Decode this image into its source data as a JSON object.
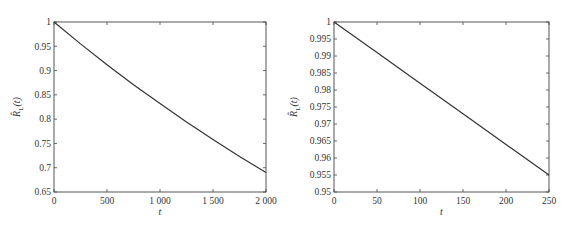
{
  "chart_data": [
    {
      "type": "line",
      "title": "",
      "xlabel": "t",
      "ylabel": "R̂_L(t)",
      "xlim": [
        0,
        2000
      ],
      "ylim": [
        0.65,
        1.0
      ],
      "grid": false,
      "legend": null,
      "x_ticks": [
        0,
        500,
        1000,
        1500,
        2000
      ],
      "x_tick_labels": [
        "0",
        "500",
        "1 000",
        "1 500",
        "2 000"
      ],
      "y_ticks": [
        0.65,
        0.7,
        0.75,
        0.8,
        0.85,
        0.9,
        0.95,
        1.0
      ],
      "y_tick_labels": [
        "0.65",
        "0.7",
        "0.75",
        "0.8",
        "0.85",
        "0.9",
        "0.95",
        "1"
      ],
      "series": [
        {
          "name": "R_L(t)",
          "color": "#333333",
          "x": [
            0,
            250,
            500,
            750,
            1000,
            1250,
            1500,
            1750,
            2000
          ],
          "y": [
            1.0,
            0.955,
            0.912,
            0.871,
            0.832,
            0.794,
            0.758,
            0.723,
            0.69
          ]
        }
      ]
    },
    {
      "type": "line",
      "title": "",
      "xlabel": "t",
      "ylabel": "R̂_L(t)",
      "xlim": [
        0,
        250
      ],
      "ylim": [
        0.95,
        1.0
      ],
      "grid": false,
      "legend": null,
      "x_ticks": [
        0,
        50,
        100,
        150,
        200,
        250
      ],
      "x_tick_labels": [
        "0",
        "50",
        "100",
        "150",
        "200",
        "250"
      ],
      "y_ticks": [
        0.95,
        0.955,
        0.96,
        0.965,
        0.97,
        0.975,
        0.98,
        0.985,
        0.99,
        0.995,
        1.0
      ],
      "y_tick_labels": [
        "0.95",
        "0.955",
        "0.96",
        "0.965",
        "0.97",
        "0.975",
        "0.98",
        "0.985",
        "0.99",
        "0.995",
        "1"
      ],
      "series": [
        {
          "name": "R_L(t)",
          "color": "#333333",
          "x": [
            0,
            50,
            100,
            150,
            200,
            250
          ],
          "y": [
            1.0,
            0.991,
            0.982,
            0.973,
            0.964,
            0.955
          ]
        }
      ]
    }
  ]
}
